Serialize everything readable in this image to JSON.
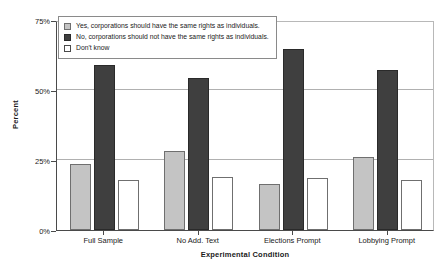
{
  "chart_data": {
    "type": "bar",
    "title": "",
    "xlabel": "Experimental Condition",
    "ylabel": "Percent",
    "categories": [
      "Full Sample",
      "No Add. Text",
      "Elections Prompt",
      "Lobbying Prompt"
    ],
    "series": [
      {
        "name": "Yes, corporations should have the same rights as individuals.",
        "color": "#c4c4c4",
        "values": [
          23.7,
          28.2,
          16.5,
          25.9
        ]
      },
      {
        "name": "No, corporations should not have the same rights as individuals.",
        "color": "#3f3f3f",
        "values": [
          58.9,
          54.3,
          64.7,
          57.1
        ]
      },
      {
        "name": "Don't know",
        "color": "#ffffff",
        "values": [
          18.0,
          18.9,
          18.6,
          18.0
        ]
      }
    ],
    "ylim": [
      0,
      75
    ],
    "yticks": [
      0,
      25,
      50,
      75
    ],
    "ytick_labels": [
      "0%",
      "25%",
      "50%",
      "75%"
    ],
    "grid": true,
    "legend_position": "top-left"
  }
}
